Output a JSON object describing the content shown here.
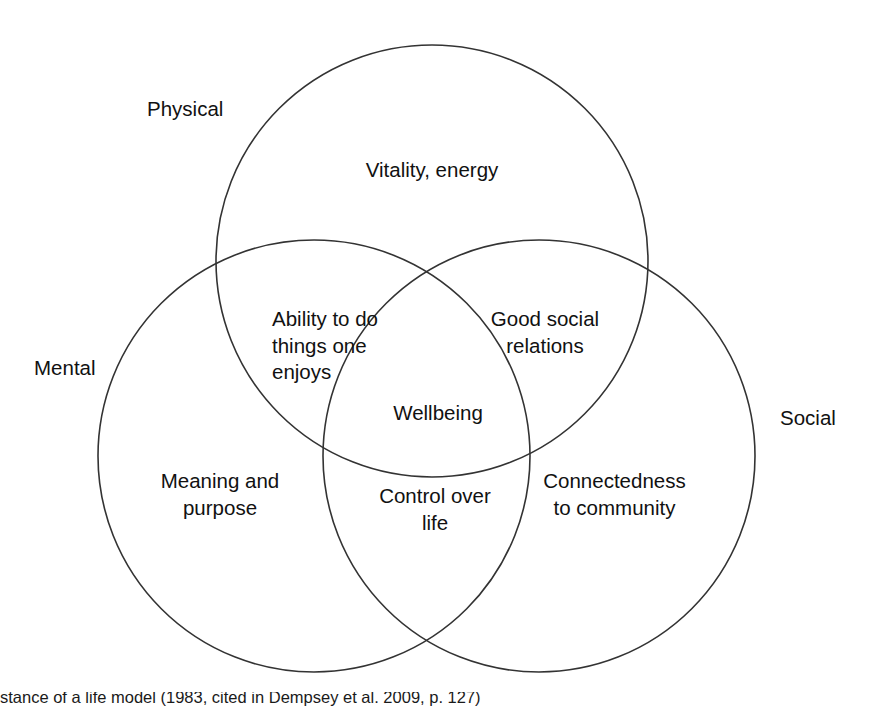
{
  "diagram": {
    "type": "venn",
    "stroke_color": "#333333",
    "background_color": "#ffffff",
    "text_color": "#111111",
    "sets": [
      {
        "key": "physical",
        "outer_label": "Physical",
        "exclusive_label": "Vitality, energy"
      },
      {
        "key": "mental",
        "outer_label": "Mental",
        "exclusive_label": "Meaning and\npurpose"
      },
      {
        "key": "social",
        "outer_label": "Social",
        "exclusive_label": "Connectedness\nto community"
      }
    ],
    "intersections": [
      {
        "key": "physical-mental",
        "label": "Ability to do\nthings one\nenjoys"
      },
      {
        "key": "physical-social",
        "label": "Good social\nrelations"
      },
      {
        "key": "mental-social",
        "label": "Control over\nlife"
      },
      {
        "key": "physical-mental-social",
        "label": "Wellbeing"
      }
    ]
  },
  "caption": {
    "text": "stance of a life model (1983, cited in Dempsey et al. 2009, p. 127)"
  }
}
